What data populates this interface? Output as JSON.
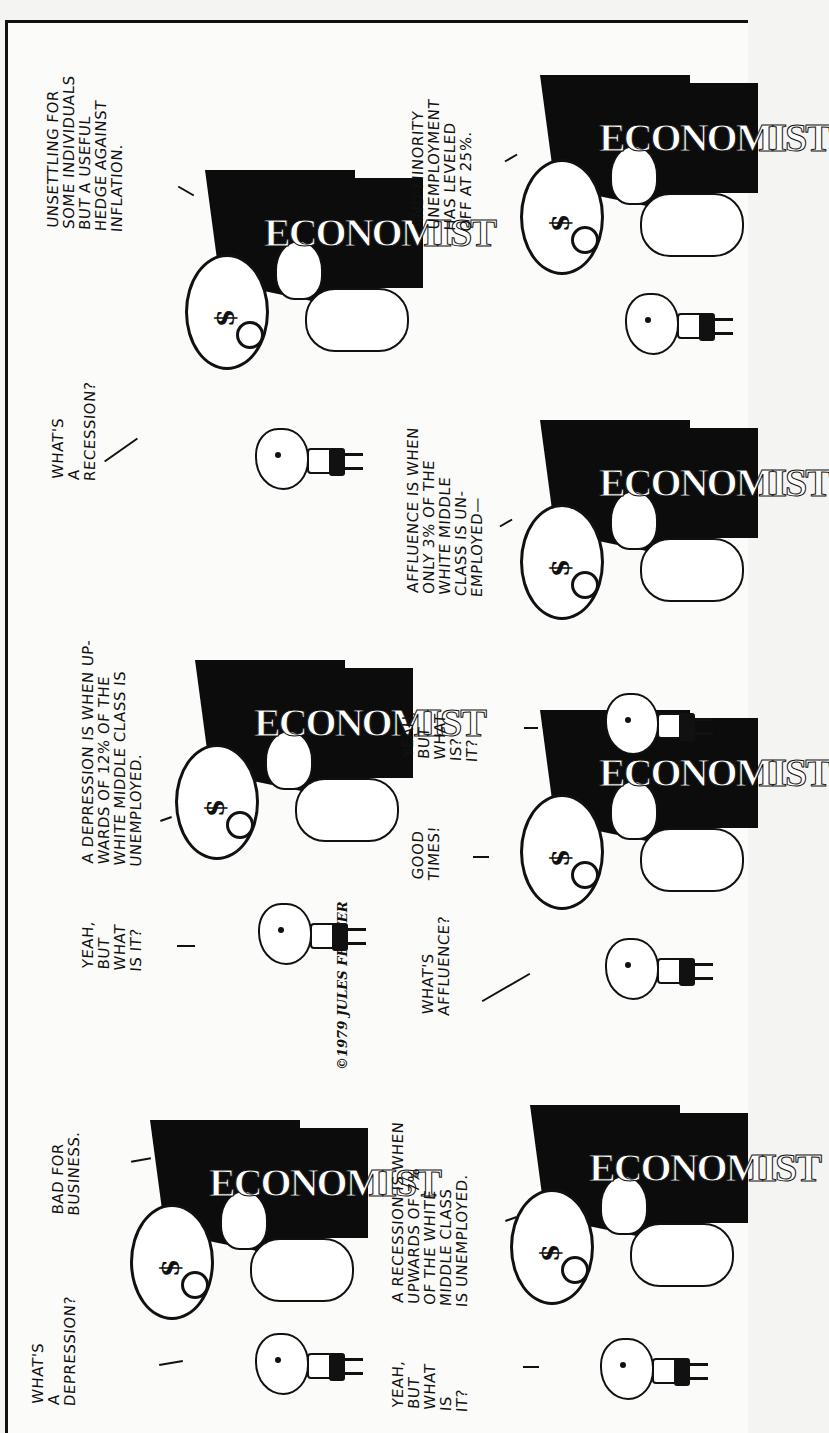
{
  "comic": {
    "signature": "©1979 JULES FEIFFER",
    "desk_sign": "ECONOMIST",
    "rows": [
      {
        "beats": [
          {
            "kid_line": "WHAT'S\nA\nDEPRESSION?",
            "economist_line": "BAD FOR\nBUSINESS."
          },
          {
            "kid_line": "YEAH,\nBUT\nWHAT\nIS IT?",
            "economist_line": "A DEPRESSION IS WHEN UP-\nWARDS OF 12% OF THE\nWHITE MIDDLE CLASS IS\nUNEMPLOYED."
          },
          {
            "kid_line": "WHAT'S\nA\nRECESSION?",
            "economist_line": "UNSETTLING FOR\nSOME INDIVIDUALS\nBUT A USEFUL\nHEDGE AGAINST\nINFLATION."
          }
        ]
      },
      {
        "beats": [
          {
            "kid_line": "YEAH,\nBUT\nWHAT\nIS\nIT?",
            "economist_line": "A RECESSION IS WHEN\nUPWARDS OF 7%\nOF THE WHITE\nMIDDLE CLASS\nIS UNEMPLOYED."
          },
          {
            "kid_line": "WHAT'S\nAFFLUENCE?",
            "economist_line": "GOOD\nTIMES!"
          },
          {
            "kid_line": "YEAH,\nBUT\nWHAT\nIS?\nIT?",
            "economist_line": "AFFLUENCE IS WHEN\nONLY 3% OF THE\nWHITE MIDDLE\nCLASS IS UN-\nEMPLOYED—"
          },
          {
            "kid_line": "",
            "economist_line": "AND MINORITY\nUNEMPLOYMENT\nHAS LEVELED\nOFF AT 25%."
          }
        ]
      }
    ]
  }
}
